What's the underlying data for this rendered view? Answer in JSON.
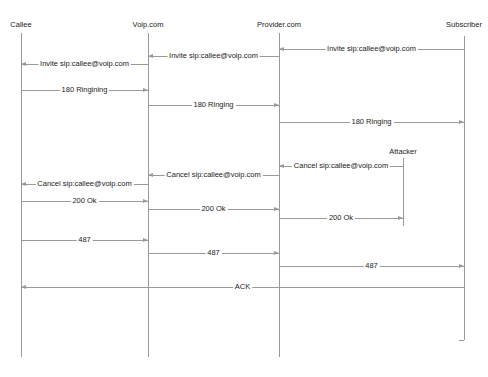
{
  "diagram": {
    "type": "sequence",
    "participants": [
      {
        "id": "callee",
        "label": "Callee",
        "x": 21,
        "label_y": 20,
        "lifeline_top": 33,
        "lifeline_bottom": 357
      },
      {
        "id": "voip",
        "label": "Voip.com",
        "x": 148,
        "label_y": 20,
        "lifeline_top": 33,
        "lifeline_bottom": 357
      },
      {
        "id": "provider",
        "label": "Provider.com",
        "x": 279,
        "label_y": 20,
        "lifeline_top": 33,
        "lifeline_bottom": 357
      },
      {
        "id": "subscriber",
        "label": "Subscriber",
        "x": 464,
        "label_y": 20,
        "lifeline_top": 36,
        "lifeline_bottom": 340
      },
      {
        "id": "attacker",
        "label": "Attacker",
        "x": 403,
        "label_y": 147,
        "lifeline_top": 158,
        "lifeline_bottom": 226
      }
    ],
    "messages": [
      {
        "from": "subscriber",
        "to": "provider",
        "label": "Invite sip:callee@voip.com",
        "y": 49
      },
      {
        "from": "provider",
        "to": "voip",
        "label": "Invite sip:callee@voip.com",
        "y": 56
      },
      {
        "from": "voip",
        "to": "callee",
        "label": "Invite sip:callee@voip.com",
        "y": 64
      },
      {
        "from": "callee",
        "to": "voip",
        "label": "180 Ringining",
        "y": 90
      },
      {
        "from": "voip",
        "to": "provider",
        "label": "180 Ringing",
        "y": 105
      },
      {
        "from": "provider",
        "to": "subscriber",
        "label": "180 Ringing",
        "y": 122
      },
      {
        "from": "attacker",
        "to": "provider",
        "label": "Cancel sip:callee@voip.com",
        "y": 166
      },
      {
        "from": "provider",
        "to": "voip",
        "label": "Cancel sip:callee@voip.com",
        "y": 175
      },
      {
        "from": "voip",
        "to": "callee",
        "label": "Cancel sip:callee@voip.com",
        "y": 184
      },
      {
        "from": "callee",
        "to": "voip",
        "label": "200 Ok",
        "y": 201
      },
      {
        "from": "voip",
        "to": "provider",
        "label": "200 Ok",
        "y": 209
      },
      {
        "from": "provider",
        "to": "attacker",
        "label": "200 Ok",
        "y": 218
      },
      {
        "from": "callee",
        "to": "voip",
        "label": "487",
        "y": 240
      },
      {
        "from": "voip",
        "to": "provider",
        "label": "487",
        "y": 253
      },
      {
        "from": "provider",
        "to": "subscriber",
        "label": "487",
        "y": 266
      },
      {
        "from": "subscriber",
        "to": "callee",
        "label": "ACK",
        "y": 287
      }
    ],
    "colors": {
      "line": "#9a9a9a",
      "text": "#222222",
      "background": "#ffffff"
    }
  }
}
